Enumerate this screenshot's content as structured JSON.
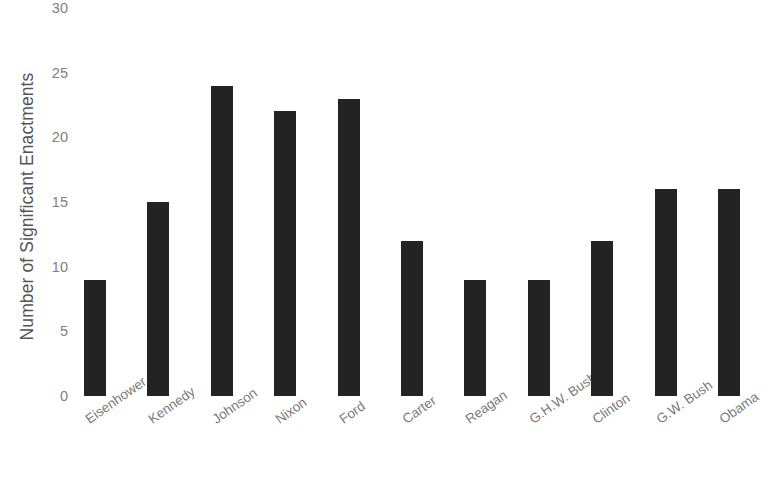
{
  "chart_data": {
    "type": "bar",
    "title": "",
    "subtitle": "",
    "xlabel": "",
    "ylabel": "Number of Significant Enactments",
    "ylim": [
      0,
      30
    ],
    "ytick_step": 5,
    "yticks": [
      "0",
      "5",
      "10",
      "15",
      "20",
      "25",
      "30"
    ],
    "grid": false,
    "legend": false,
    "bar_color": "#232323",
    "categories": [
      "Eisenhower",
      "Kennedy",
      "Johnson",
      "Nixon",
      "Ford",
      "Carter",
      "Reagan",
      "G.H.W. Bush",
      "Clinton",
      "G.W. Bush",
      "Obama",
      "Trump"
    ],
    "values": [
      9,
      15,
      24,
      22,
      23,
      12,
      9,
      9,
      12,
      16,
      16,
      12
    ]
  }
}
